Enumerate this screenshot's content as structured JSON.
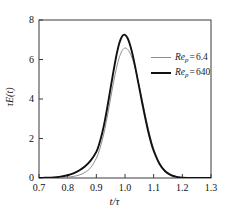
{
  "chart_data": {
    "type": "line",
    "title": "",
    "xlabel": "t/τ",
    "ylabel": "τE(t)",
    "xlim": [
      0.7,
      1.3
    ],
    "ylim": [
      0,
      8
    ],
    "xticks": [
      "0.7",
      "0.8",
      "0.9",
      "1.0",
      "1.1",
      "1.2",
      "1.3"
    ],
    "xtick_values": [
      0.7,
      0.8,
      0.9,
      1.0,
      1.1,
      1.2,
      1.3
    ],
    "yticks": [
      "0",
      "2",
      "4",
      "6",
      "8"
    ],
    "ytick_values": [
      0,
      2,
      4,
      6,
      8
    ],
    "grid": false,
    "legend_position": "upper-right-inside",
    "series": [
      {
        "name": "Re_p = 6.4",
        "color": "#8c8c8c",
        "linewidth": 1.0,
        "x": [
          0.7,
          0.72,
          0.74,
          0.76,
          0.78,
          0.8,
          0.82,
          0.84,
          0.86,
          0.88,
          0.9,
          0.91,
          0.92,
          0.93,
          0.94,
          0.95,
          0.96,
          0.97,
          0.98,
          0.99,
          1.0,
          1.01,
          1.02,
          1.03,
          1.04,
          1.05,
          1.06,
          1.07,
          1.08,
          1.09,
          1.1,
          1.12,
          1.14,
          1.16,
          1.18,
          1.2,
          1.24,
          1.3
        ],
        "y": [
          0.0,
          0.0,
          0.0,
          0.01,
          0.02,
          0.04,
          0.08,
          0.15,
          0.28,
          0.52,
          1.0,
          1.38,
          1.88,
          2.5,
          3.25,
          4.05,
          4.85,
          5.55,
          6.1,
          6.45,
          6.58,
          6.5,
          6.25,
          5.85,
          5.3,
          4.65,
          3.95,
          3.25,
          2.58,
          1.98,
          1.48,
          0.78,
          0.38,
          0.17,
          0.07,
          0.03,
          0.01,
          0.0
        ]
      },
      {
        "name": "Re_p = 640",
        "color": "#111111",
        "linewidth": 1.9,
        "x": [
          0.7,
          0.72,
          0.74,
          0.76,
          0.78,
          0.8,
          0.82,
          0.84,
          0.86,
          0.88,
          0.9,
          0.91,
          0.92,
          0.93,
          0.94,
          0.95,
          0.96,
          0.97,
          0.98,
          0.99,
          1.0,
          1.01,
          1.02,
          1.03,
          1.04,
          1.05,
          1.06,
          1.07,
          1.08,
          1.09,
          1.1,
          1.12,
          1.14,
          1.16,
          1.18,
          1.2,
          1.24,
          1.3
        ],
        "y": [
          0.0,
          0.01,
          0.02,
          0.04,
          0.08,
          0.14,
          0.24,
          0.38,
          0.58,
          0.88,
          1.32,
          1.72,
          2.25,
          2.92,
          3.72,
          4.58,
          5.42,
          6.2,
          6.82,
          7.18,
          7.25,
          7.05,
          6.62,
          6.02,
          5.3,
          4.55,
          3.8,
          3.08,
          2.42,
          1.85,
          1.38,
          0.72,
          0.34,
          0.15,
          0.06,
          0.02,
          0.0,
          0.0
        ]
      }
    ],
    "legend": [
      {
        "label_base": "Re",
        "label_sub": "p",
        "equals": "=",
        "value": "6.4",
        "color": "#8c8c8c",
        "linewidth": 1.0
      },
      {
        "label_base": "Re",
        "label_sub": "p",
        "equals": "=",
        "value": "640",
        "color": "#111111",
        "linewidth": 2.2
      }
    ],
    "axis_color": "#3a3a3a"
  }
}
